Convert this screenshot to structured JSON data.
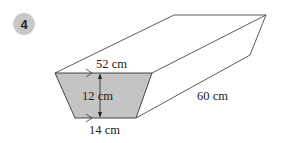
{
  "question_number": "4",
  "labels": {
    "top_width": "52 cm",
    "height": "12 cm",
    "bottom_width": "14 cm",
    "length": "60 cm"
  },
  "colors": {
    "face_fill": "#c4c4c4",
    "line": "#333333",
    "badge": "#c8c8c8"
  }
}
